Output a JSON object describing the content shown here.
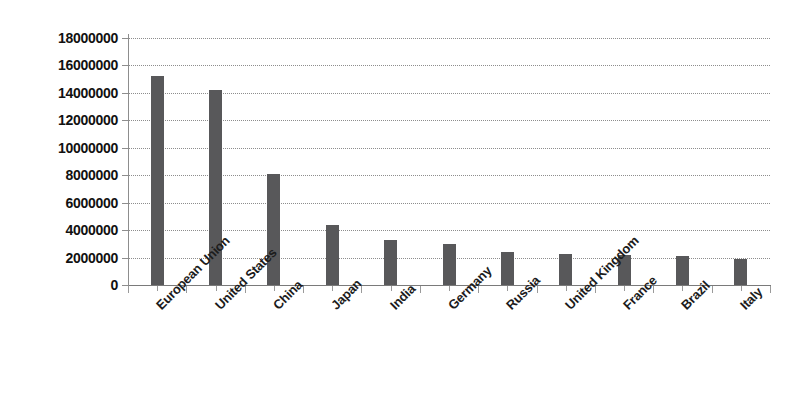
{
  "chart_data": {
    "type": "bar",
    "title": "",
    "subtitle": "",
    "xlabel": "",
    "ylabel": "",
    "categories": [
      "European Union",
      "United States",
      "China",
      "Japan",
      "India",
      "Germany",
      "Russia",
      "United Kingdom",
      "France",
      "Brazil",
      "Italy"
    ],
    "values": [
      15200000,
      14200000,
      8100000,
      4400000,
      3300000,
      3000000,
      2400000,
      2250000,
      2200000,
      2100000,
      1900000
    ],
    "ylim": [
      0,
      18000000
    ],
    "ytick_step": 2000000,
    "ytick_labels": [
      "18000000",
      "16000000",
      "14000000",
      "12000000",
      "10000000",
      "8000000",
      "6000000",
      "4000000",
      "2000000",
      "0"
    ],
    "ytick_values": [
      18000000,
      16000000,
      14000000,
      12000000,
      10000000,
      8000000,
      6000000,
      4000000,
      2000000,
      0
    ],
    "grid": true,
    "grid_axis": "y",
    "grid_style": "dotted",
    "legend": false,
    "legend_position": "none",
    "bar_color": "#58585a",
    "grid_color": "#8d8d8d",
    "axis_color": "#7a7a7a",
    "background_color": "#ffffff",
    "xtick_label_rotation": -45,
    "series": [
      {
        "name": "",
        "values": [
          15200000,
          14200000,
          8100000,
          4400000,
          3300000,
          3000000,
          2400000,
          2250000,
          2200000,
          2100000,
          1900000
        ]
      }
    ]
  }
}
